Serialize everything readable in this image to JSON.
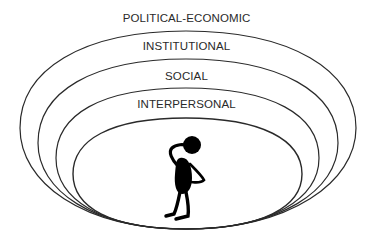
{
  "diagram": {
    "type": "nested-ellipses",
    "levels": [
      {
        "label": "POLITICAL-ECONOMIC"
      },
      {
        "label": "INSTITUTIONAL"
      },
      {
        "label": "SOCIAL"
      },
      {
        "label": "INTERPERSONAL"
      }
    ],
    "center_figure": "person-scratching-head",
    "colors": {
      "stroke": "#2a2a2a",
      "text": "#2a2a2a",
      "background": "#ffffff"
    }
  }
}
